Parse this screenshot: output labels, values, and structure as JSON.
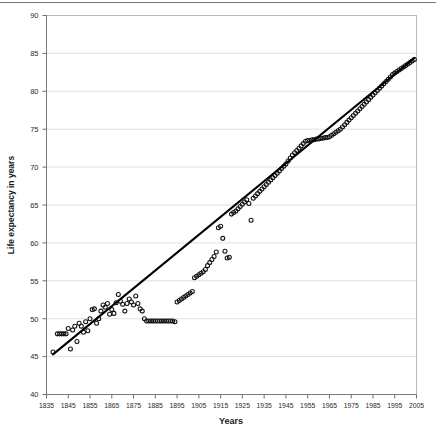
{
  "chart_data": {
    "type": "scatter",
    "title": "",
    "xlabel": "Years",
    "ylabel": "Life expectancy in years",
    "xlim": [
      1835,
      2005
    ],
    "ylim": [
      40,
      90
    ],
    "xticks": [
      1835,
      1845,
      1855,
      1865,
      1875,
      1885,
      1895,
      1905,
      1915,
      1925,
      1935,
      1945,
      1955,
      1965,
      1975,
      1985,
      1995,
      2005
    ],
    "yticks": [
      40,
      45,
      50,
      55,
      60,
      65,
      70,
      75,
      80,
      85,
      90
    ],
    "grid": true,
    "grid_axis": "y",
    "legend": "none",
    "marker": "open-circle",
    "marker_color": "#101010",
    "fit_line": {
      "label": "linear trend",
      "color": "#000000",
      "x_start": 1838,
      "y_start": 45.3,
      "x_end": 2004,
      "y_end": 84.4
    },
    "x": [
      1838,
      1840,
      1841,
      1842,
      1843,
      1844,
      1845,
      1846,
      1847,
      1848,
      1849,
      1850,
      1851,
      1852,
      1853,
      1854,
      1855,
      1856,
      1857,
      1858,
      1859,
      1860,
      1861,
      1862,
      1863,
      1864,
      1865,
      1866,
      1867,
      1868,
      1869,
      1870,
      1871,
      1872,
      1873,
      1874,
      1875,
      1876,
      1877,
      1878,
      1879,
      1880,
      1881,
      1882,
      1883,
      1884,
      1885,
      1886,
      1887,
      1888,
      1889,
      1890,
      1891,
      1892,
      1893,
      1894,
      1895,
      1896,
      1897,
      1898,
      1899,
      1900,
      1901,
      1902,
      1903,
      1904,
      1905,
      1906,
      1907,
      1908,
      1909,
      1910,
      1911,
      1912,
      1913,
      1914,
      1915,
      1916,
      1917,
      1918,
      1919,
      1920,
      1921,
      1922,
      1923,
      1924,
      1925,
      1926,
      1927,
      1928,
      1929,
      1930,
      1931,
      1932,
      1933,
      1934,
      1935,
      1936,
      1937,
      1938,
      1939,
      1940,
      1941,
      1942,
      1943,
      1944,
      1945,
      1946,
      1947,
      1948,
      1949,
      1950,
      1951,
      1952,
      1953,
      1954,
      1955,
      1956,
      1957,
      1958,
      1959,
      1960,
      1961,
      1962,
      1963,
      1964,
      1965,
      1966,
      1967,
      1968,
      1969,
      1970,
      1971,
      1972,
      1973,
      1974,
      1975,
      1976,
      1977,
      1978,
      1979,
      1980,
      1981,
      1982,
      1983,
      1984,
      1985,
      1986,
      1987,
      1988,
      1989,
      1990,
      1991,
      1992,
      1993,
      1994,
      1995,
      1996,
      1997,
      1998,
      1999,
      2000,
      2001,
      2002,
      2003,
      2004
    ],
    "y": [
      45.6,
      48.0,
      48.0,
      48.0,
      48.0,
      48.0,
      48.7,
      46.0,
      48.5,
      49.0,
      47.0,
      49.4,
      49.0,
      48.2,
      49.6,
      48.4,
      50.0,
      51.2,
      51.3,
      49.4,
      50.0,
      51.0,
      51.8,
      51.5,
      52.0,
      50.6,
      51.2,
      50.7,
      52.1,
      53.2,
      52.3,
      51.9,
      51.0,
      52.0,
      52.6,
      52.2,
      51.8,
      53.0,
      52.0,
      51.3,
      51.0,
      50.0,
      49.7,
      49.7,
      49.7,
      49.7,
      49.7,
      49.7,
      49.7,
      49.7,
      49.7,
      49.7,
      49.7,
      49.7,
      49.7,
      49.6,
      52.2,
      52.4,
      52.6,
      52.8,
      53.0,
      53.2,
      53.4,
      53.6,
      55.4,
      55.6,
      55.8,
      56.0,
      56.2,
      56.5,
      57.0,
      57.4,
      57.8,
      58.2,
      58.8,
      62.0,
      62.2,
      60.6,
      58.9,
      58.0,
      58.1,
      63.8,
      64.0,
      64.2,
      64.5,
      64.8,
      65.1,
      65.4,
      65.7,
      65.2,
      63.0,
      65.9,
      66.2,
      66.5,
      66.8,
      67.1,
      67.4,
      67.7,
      68.0,
      68.3,
      68.6,
      68.9,
      69.2,
      69.5,
      69.8,
      70.1,
      70.4,
      70.8,
      71.2,
      71.6,
      71.9,
      72.2,
      72.5,
      72.8,
      73.1,
      73.4,
      73.5,
      73.5,
      73.6,
      73.6,
      73.7,
      73.7,
      73.8,
      73.8,
      73.9,
      73.9,
      74.0,
      74.2,
      74.4,
      74.6,
      74.8,
      75.0,
      75.3,
      75.6,
      75.9,
      76.2,
      76.5,
      76.8,
      77.1,
      77.4,
      77.7,
      78.0,
      78.3,
      78.6,
      78.9,
      79.2,
      79.5,
      79.8,
      80.1,
      80.4,
      80.7,
      81.0,
      81.3,
      81.6,
      81.9,
      82.2,
      82.4,
      82.6,
      82.8,
      83.0,
      83.2,
      83.4,
      83.6,
      83.8,
      84.0,
      84.2,
      84.4
    ]
  }
}
